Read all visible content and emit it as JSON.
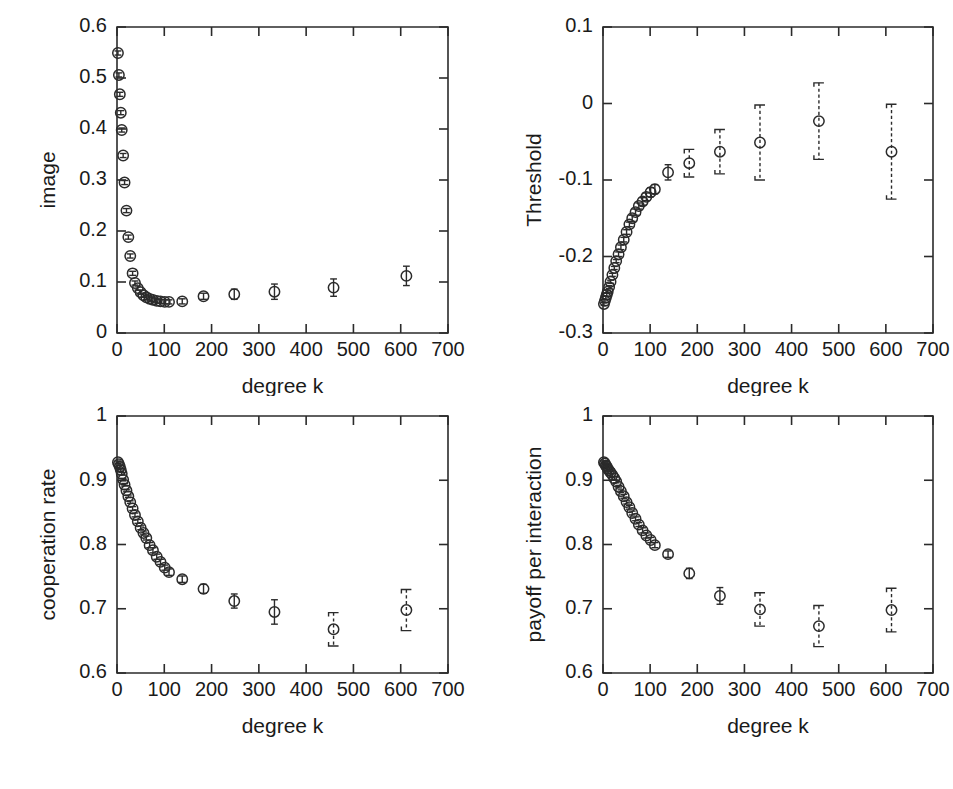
{
  "figure": {
    "panel_count": 4,
    "marker_style": "open-circle",
    "errorbar_style": "dashed-bracket-caps",
    "line_color": "#2b2b2b",
    "background_color": "#ffffff"
  },
  "chart_data": [
    {
      "type": "scatter",
      "panel": "top-left",
      "title": "",
      "xlabel": "degree k",
      "ylabel": "image",
      "xlim": [
        0,
        700
      ],
      "ylim": [
        0,
        0.6
      ],
      "xticks": [
        0,
        100,
        200,
        300,
        400,
        500,
        600,
        700
      ],
      "xticklabels": [
        "0",
        "100",
        "200",
        "300",
        "400",
        "500",
        "600",
        "700"
      ],
      "yticks": [
        0,
        0.1,
        0.2,
        0.3,
        0.4,
        0.5,
        0.6
      ],
      "yticklabels": [
        "0",
        "0.1",
        "0.2",
        "0.3",
        "0.4",
        "0.5",
        "0.6"
      ],
      "grid": false,
      "legend": "none",
      "x": [
        2,
        4,
        6,
        8,
        10,
        13,
        16,
        20,
        24,
        28,
        33,
        38,
        44,
        50,
        56,
        62,
        69,
        76,
        84,
        92,
        101,
        110,
        138,
        183,
        248,
        333,
        458,
        612
      ],
      "y": [
        0.549,
        0.506,
        0.468,
        0.432,
        0.398,
        0.348,
        0.295,
        0.24,
        0.188,
        0.151,
        0.117,
        0.098,
        0.088,
        0.08,
        0.074,
        0.07,
        0.067,
        0.065,
        0.063,
        0.062,
        0.061,
        0.061,
        0.062,
        0.072,
        0.076,
        0.081,
        0.089,
        0.112
      ],
      "yerr": [
        0.004,
        0.004,
        0.004,
        0.004,
        0.004,
        0.004,
        0.004,
        0.004,
        0.004,
        0.004,
        0.004,
        0.004,
        0.004,
        0.004,
        0.004,
        0.004,
        0.004,
        0.004,
        0.004,
        0.004,
        0.004,
        0.004,
        0.005,
        0.006,
        0.01,
        0.015,
        0.017,
        0.019
      ]
    },
    {
      "type": "scatter",
      "panel": "top-right",
      "title": "",
      "xlabel": "degree k",
      "ylabel": "Threshold",
      "xlim": [
        0,
        700
      ],
      "ylim": [
        -0.3,
        0.1
      ],
      "xticks": [
        0,
        100,
        200,
        300,
        400,
        500,
        600,
        700
      ],
      "xticklabels": [
        "0",
        "100",
        "200",
        "300",
        "400",
        "500",
        "600",
        "700"
      ],
      "yticks": [
        -0.3,
        -0.2,
        -0.1,
        0,
        0.1
      ],
      "yticklabels": [
        "-0.3",
        "-0.2",
        "-0.1",
        "0",
        "0.1"
      ],
      "grid": false,
      "legend": "none",
      "x": [
        2,
        4,
        6,
        8,
        10,
        13,
        16,
        20,
        24,
        28,
        33,
        38,
        44,
        50,
        56,
        62,
        69,
        76,
        84,
        92,
        101,
        110,
        138,
        183,
        248,
        333,
        458,
        612
      ],
      "y": [
        -0.262,
        -0.258,
        -0.254,
        -0.25,
        -0.246,
        -0.24,
        -0.233,
        -0.224,
        -0.215,
        -0.206,
        -0.197,
        -0.188,
        -0.178,
        -0.168,
        -0.158,
        -0.15,
        -0.142,
        -0.134,
        -0.128,
        -0.122,
        -0.116,
        -0.112,
        -0.09,
        -0.078,
        -0.063,
        -0.051,
        -0.023,
        -0.063
      ],
      "yerr": [
        0.002,
        0.002,
        0.002,
        0.002,
        0.002,
        0.002,
        0.002,
        0.002,
        0.002,
        0.002,
        0.003,
        0.003,
        0.003,
        0.003,
        0.003,
        0.004,
        0.004,
        0.004,
        0.005,
        0.005,
        0.006,
        0.006,
        0.01,
        0.018,
        0.029,
        0.049,
        0.05,
        0.062
      ]
    },
    {
      "type": "scatter",
      "panel": "bottom-left",
      "title": "",
      "xlabel": "degree k",
      "ylabel": "cooperation rate",
      "xlim": [
        0,
        700
      ],
      "ylim": [
        0.6,
        1.0
      ],
      "xticks": [
        0,
        100,
        200,
        300,
        400,
        500,
        600,
        700
      ],
      "xticklabels": [
        "0",
        "100",
        "200",
        "300",
        "400",
        "500",
        "600",
        "700"
      ],
      "yticks": [
        0.6,
        0.7,
        0.8,
        0.9,
        1.0
      ],
      "yticklabels": [
        "0.6",
        "0.7",
        "0.8",
        "0.9",
        "1"
      ],
      "grid": false,
      "legend": "none",
      "x": [
        2,
        4,
        6,
        8,
        10,
        13,
        16,
        20,
        24,
        28,
        33,
        38,
        44,
        50,
        56,
        62,
        69,
        76,
        84,
        92,
        101,
        110,
        138,
        183,
        248,
        333,
        458,
        612
      ],
      "y": [
        0.928,
        0.925,
        0.921,
        0.916,
        0.91,
        0.901,
        0.893,
        0.884,
        0.875,
        0.866,
        0.856,
        0.846,
        0.836,
        0.826,
        0.818,
        0.81,
        0.799,
        0.791,
        0.781,
        0.773,
        0.764,
        0.757,
        0.746,
        0.731,
        0.712,
        0.695,
        0.668,
        0.698
      ],
      "yerr": [
        0.002,
        0.002,
        0.002,
        0.002,
        0.002,
        0.002,
        0.002,
        0.002,
        0.002,
        0.002,
        0.003,
        0.003,
        0.003,
        0.003,
        0.003,
        0.003,
        0.004,
        0.004,
        0.004,
        0.004,
        0.004,
        0.005,
        0.005,
        0.007,
        0.011,
        0.019,
        0.026,
        0.032
      ]
    },
    {
      "type": "scatter",
      "panel": "bottom-right",
      "title": "",
      "xlabel": "degree k",
      "ylabel": "payoff per interaction",
      "xlim": [
        0,
        700
      ],
      "ylim": [
        0.6,
        1.0
      ],
      "xticks": [
        0,
        100,
        200,
        300,
        400,
        500,
        600,
        700
      ],
      "xticklabels": [
        "0",
        "100",
        "200",
        "300",
        "400",
        "500",
        "600",
        "700"
      ],
      "yticks": [
        0.6,
        0.7,
        0.8,
        0.9,
        1.0
      ],
      "yticklabels": [
        "0.6",
        "0.7",
        "0.8",
        "0.9",
        "1"
      ],
      "grid": false,
      "legend": "none",
      "x": [
        2,
        4,
        6,
        8,
        10,
        13,
        16,
        20,
        24,
        28,
        33,
        38,
        44,
        50,
        56,
        62,
        69,
        76,
        84,
        92,
        101,
        110,
        138,
        183,
        248,
        333,
        458,
        612
      ],
      "y": [
        0.928,
        0.926,
        0.923,
        0.921,
        0.918,
        0.915,
        0.912,
        0.908,
        0.903,
        0.898,
        0.89,
        0.883,
        0.875,
        0.866,
        0.858,
        0.849,
        0.84,
        0.831,
        0.822,
        0.814,
        0.807,
        0.799,
        0.785,
        0.755,
        0.72,
        0.699,
        0.673,
        0.698
      ],
      "yerr": [
        0.002,
        0.002,
        0.002,
        0.002,
        0.002,
        0.002,
        0.002,
        0.002,
        0.002,
        0.002,
        0.002,
        0.002,
        0.003,
        0.003,
        0.003,
        0.003,
        0.003,
        0.003,
        0.004,
        0.004,
        0.004,
        0.004,
        0.005,
        0.008,
        0.013,
        0.026,
        0.032,
        0.034
      ]
    }
  ]
}
